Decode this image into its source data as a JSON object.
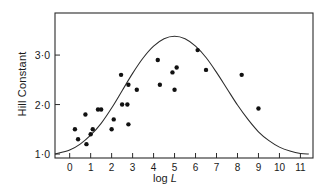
{
  "figure": {
    "y_axis_title": "Hill Constant",
    "x_axis_title_prefix": "log",
    "x_axis_title_symbol": "L",
    "x_tick_labels": [
      "0",
      "1",
      "2",
      "3",
      "4",
      "5",
      "6",
      "7",
      "8",
      "9",
      "10",
      "11"
    ],
    "y_tick_labels": [
      "1·0",
      "2·0",
      "3·0"
    ],
    "point_color": "#111111",
    "curve_color": "#2b2b2b",
    "frame_color": "#2b2b2b"
  },
  "chart_data": {
    "type": "scatter",
    "title": "",
    "xlabel": "log L",
    "ylabel": "Hill Constant",
    "xlim": [
      -0.7,
      11.6
    ],
    "ylim": [
      0.92,
      3.85
    ],
    "xticks": [
      0,
      1,
      2,
      3,
      4,
      5,
      6,
      7,
      8,
      9,
      10,
      11
    ],
    "yticks": [
      1.0,
      2.0,
      3.0
    ],
    "ytick_labels": [
      "1·0",
      "2·0",
      "3·0"
    ],
    "grid": false,
    "legend": null,
    "series": [
      {
        "name": "observations",
        "type": "scatter",
        "marker": "filled-circle",
        "x": [
          0.25,
          0.4,
          0.75,
          0.8,
          1.0,
          1.1,
          1.35,
          1.5,
          2.0,
          2.1,
          2.45,
          2.5,
          2.75,
          2.8,
          2.8,
          3.2,
          4.2,
          4.3,
          4.9,
          5.0,
          5.1,
          6.1,
          6.5,
          8.2,
          9.0
        ],
        "y": [
          1.5,
          1.3,
          1.8,
          1.2,
          1.4,
          1.5,
          1.9,
          1.9,
          1.5,
          1.7,
          2.6,
          2.0,
          2.0,
          1.6,
          2.4,
          2.3,
          2.9,
          2.4,
          2.65,
          2.3,
          2.75,
          3.1,
          2.7,
          2.6,
          1.92
        ]
      },
      {
        "name": "fitted curve",
        "type": "line",
        "description": "bell-shaped fitted curve peaking near log L = 5",
        "x": [
          -0.7,
          0.0,
          0.5,
          1.0,
          1.5,
          2.0,
          2.5,
          3.0,
          3.5,
          4.0,
          4.5,
          5.0,
          5.5,
          6.0,
          6.5,
          7.0,
          7.5,
          8.0,
          8.5,
          9.0,
          9.5,
          10.0,
          10.5,
          11.0,
          11.4
        ],
        "y": [
          1.0,
          1.08,
          1.2,
          1.38,
          1.62,
          1.93,
          2.28,
          2.63,
          2.94,
          3.18,
          3.33,
          3.38,
          3.33,
          3.18,
          2.95,
          2.65,
          2.32,
          1.99,
          1.7,
          1.45,
          1.27,
          1.14,
          1.06,
          1.01,
          1.0
        ]
      }
    ]
  }
}
